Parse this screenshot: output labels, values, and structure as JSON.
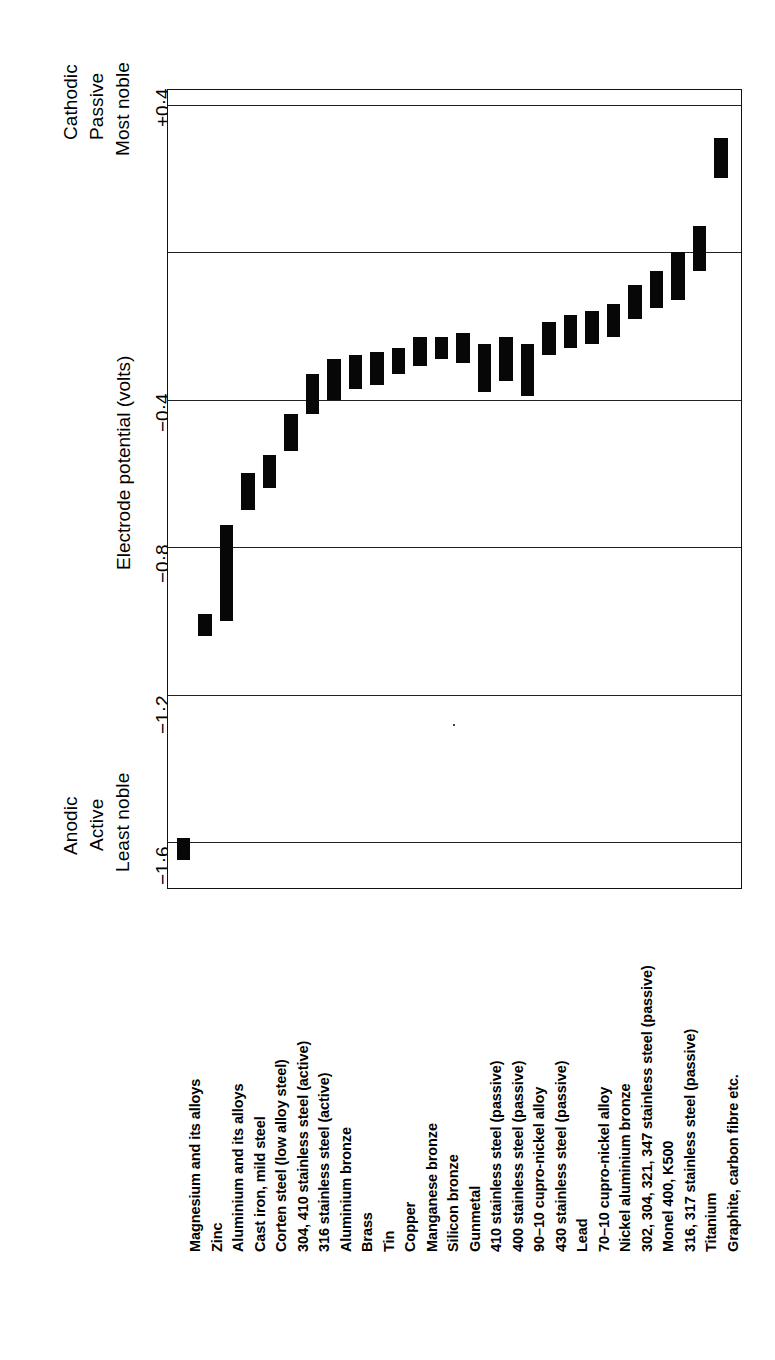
{
  "figure": {
    "axis_title": "Electrode potential (volts)",
    "top_annotation": [
      "Cathodic",
      "Passive",
      "Most noble"
    ],
    "bottom_annotation": [
      "Anodic",
      "Active",
      "Least noble"
    ],
    "tick_labels": [
      "+0·4",
      "−0·4",
      "−0·8",
      "−1·2",
      "−1·6"
    ]
  },
  "chart_data": {
    "type": "bar",
    "title": "",
    "subtitle": "",
    "orientation": "vertical-bars-ranged",
    "xlabel": "",
    "ylabel": "Electrode potential (volts)",
    "ylim": [
      -1.73,
      0.44
    ],
    "grid": true,
    "legend": null,
    "yticks": [
      0.4,
      0.0,
      -0.4,
      -0.8,
      -1.2,
      -1.6
    ],
    "ytick_labels": [
      "+0·4",
      "",
      "−0·4",
      "−0·8",
      "−1·2",
      "−1·6"
    ],
    "annotations": [
      {
        "text": "Cathodic / Passive / Most noble",
        "position": "top-left"
      },
      {
        "text": "Anodic / Active / Least noble",
        "position": "bottom-left"
      }
    ],
    "categories": [
      "Magnesium and its alloys",
      "Zinc",
      "Aluminium and its alloys",
      "Cast iron, mild steel",
      "Corten steel (low alloy steel)",
      "304, 410 stainless steel (active)",
      "316 stainless steel (active)",
      "Aluminium bronze",
      "Brass",
      "Tin",
      "Copper",
      "Manganese bronze",
      "Silicon bronze",
      "Gunmetal",
      "410 stainless steel (passive)",
      "400 stainless steel (passive)",
      "90–10 cupro-nickel alloy",
      "430 stainless steel (passive)",
      "Lead",
      "70–10 cupro-nickel alloy",
      "Nickel aluminium bronze",
      "302, 304, 321, 347 stainless steel (passive)",
      "Monel 400, K500",
      "316, 317 stainless steel (passive)",
      "Titanium",
      "Graphite, carbon fibre etc."
    ],
    "ranges": [
      {
        "category": "Magnesium and its alloys",
        "low": -1.65,
        "high": -1.59
      },
      {
        "category": "Zinc",
        "low": -1.04,
        "high": -0.98
      },
      {
        "category": "Aluminium and its alloys",
        "low": -1.0,
        "high": -0.74
      },
      {
        "category": "Cast iron, mild steel",
        "low": -0.7,
        "high": -0.6
      },
      {
        "category": "Corten steel (low alloy steel)",
        "low": -0.64,
        "high": -0.55
      },
      {
        "category": "304, 410 stainless steel (active)",
        "low": -0.54,
        "high": -0.44
      },
      {
        "category": "316 stainless steel (active)",
        "low": -0.44,
        "high": -0.33
      },
      {
        "category": "Aluminium bronze",
        "low": -0.4,
        "high": -0.29
      },
      {
        "category": "Brass",
        "low": -0.37,
        "high": -0.28
      },
      {
        "category": "Tin",
        "low": -0.36,
        "high": -0.27
      },
      {
        "category": "Copper",
        "low": -0.33,
        "high": -0.26
      },
      {
        "category": "Manganese bronze",
        "low": -0.31,
        "high": -0.23
      },
      {
        "category": "Silicon bronze",
        "low": -0.29,
        "high": -0.23
      },
      {
        "category": "Gunmetal",
        "low": -0.3,
        "high": -0.22
      },
      {
        "category": "410 stainless steel (passive)",
        "low": -0.38,
        "high": -0.25
      },
      {
        "category": "400 stainless steel (passive)",
        "low": -0.35,
        "high": -0.23
      },
      {
        "category": "90–10 cupro-nickel alloy",
        "low": -0.39,
        "high": -0.25
      },
      {
        "category": "430 stainless steel (passive)",
        "low": -0.28,
        "high": -0.19
      },
      {
        "category": "Lead",
        "low": -0.26,
        "high": -0.17
      },
      {
        "category": "70–10 cupro-nickel alloy",
        "low": -0.25,
        "high": -0.16
      },
      {
        "category": "Nickel aluminium bronze",
        "low": -0.23,
        "high": -0.14
      },
      {
        "category": "302, 304, 321, 347 stainless steel (passive)",
        "low": -0.18,
        "high": -0.09
      },
      {
        "category": "Monel 400, K500",
        "low": -0.15,
        "high": -0.05
      },
      {
        "category": "316, 317 stainless steel (passive)",
        "low": -0.13,
        "high": 0.0
      },
      {
        "category": "Titanium",
        "low": -0.05,
        "high": 0.07
      },
      {
        "category": "Graphite, carbon fibre etc.",
        "low": 0.2,
        "high": 0.31
      }
    ]
  }
}
